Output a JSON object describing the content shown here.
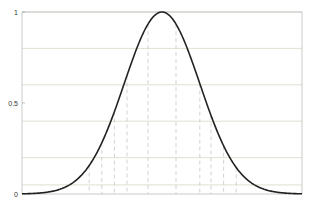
{
  "chart_data": {
    "type": "line",
    "title": "",
    "xlabel": "",
    "ylabel": "",
    "ylim": [
      0,
      1
    ],
    "xlim": [
      0,
      1
    ],
    "grid": false,
    "legend": null,
    "y_tick_labels": [
      "0",
      "0.5",
      "1"
    ],
    "y_ticks": [
      0,
      0.5,
      1
    ],
    "series": [
      {
        "name": "bell-curve",
        "description": "Gaussian-shaped membership curve centered at x=0.5, peak value 1",
        "center": 0.5,
        "peak": 1.0,
        "color": "#222222"
      }
    ],
    "level_lines": [
      1.0,
      0.8,
      0.6,
      0.4,
      0.2,
      0.05
    ],
    "cut_pairs_x": [
      [
        0.45,
        0.55
      ],
      [
        0.375,
        0.635
      ],
      [
        0.33,
        0.675
      ],
      [
        0.285,
        0.72
      ],
      [
        0.24,
        0.765
      ]
    ],
    "colors": {
      "curve": "#222222",
      "axis": "#bbbbbb",
      "level_line": "#d8d8c8",
      "dashed": "#c8c8c8"
    }
  }
}
